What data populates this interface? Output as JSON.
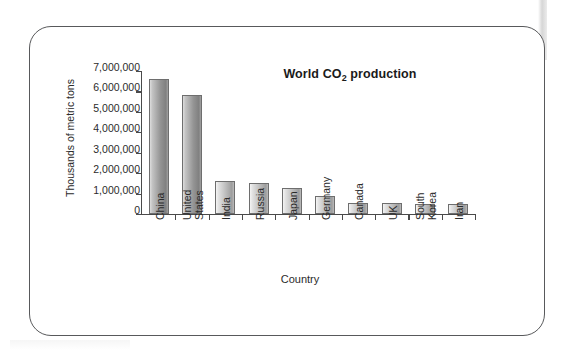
{
  "figure": {
    "frame_border_color": "#58595b",
    "background": "#ffffff"
  },
  "chart_data": {
    "type": "bar",
    "title": "World CO2 production",
    "title_main": "World CO",
    "title_sub": "2",
    "title_tail": " production",
    "xlabel": "Country",
    "ylabel": "Thousands of metric tons",
    "categories": [
      "China",
      "United States",
      "India",
      "Russia",
      "Japan",
      "Germany",
      "Canada",
      "UK",
      "South Korea",
      "Iran"
    ],
    "category_lines": [
      [
        "China"
      ],
      [
        "United",
        "States"
      ],
      [
        "India"
      ],
      [
        "Russia"
      ],
      [
        "Japan"
      ],
      [
        "Germany"
      ],
      [
        "Canada"
      ],
      [
        "UK"
      ],
      [
        "South",
        "Korea"
      ],
      [
        "Iran"
      ]
    ],
    "values": [
      6600000,
      5850000,
      1600000,
      1520000,
      1250000,
      870000,
      560000,
      520000,
      490000,
      470000
    ],
    "ylim": [
      0,
      7000000
    ],
    "ytick_values": [
      7000000,
      6000000,
      5000000,
      4000000,
      3000000,
      2000000,
      1000000,
      0
    ],
    "ytick_labels": [
      "7,000,000",
      "6,000,000",
      "5,000,000",
      "4,000,000",
      "3,000,000",
      "2,000,000",
      "1,000,000",
      "0"
    ],
    "grid": false,
    "legend": null,
    "bar_fill_light": "#d8d8d8",
    "bar_fill_dark": "#a8a8a8",
    "bar_edge_color": "#6e6e6e",
    "axis_color": "#4a4a4a"
  }
}
